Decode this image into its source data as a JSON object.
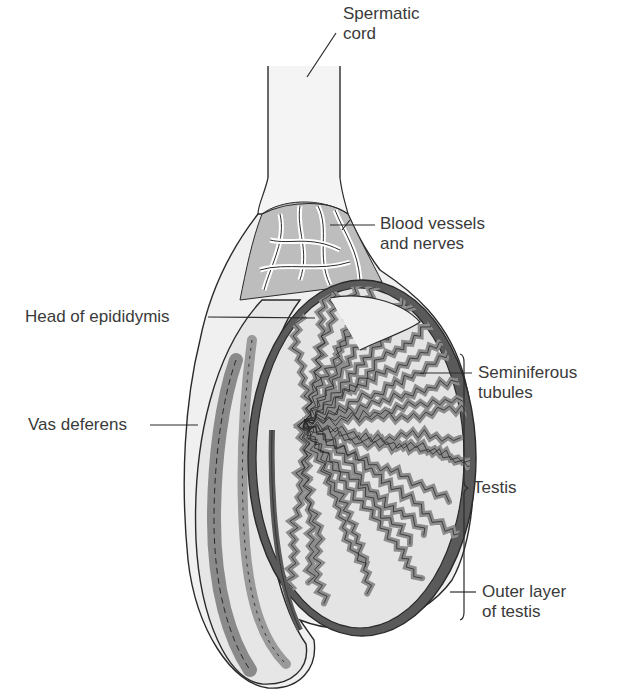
{
  "diagram": {
    "colors": {
      "outline": "#2a2a2a",
      "dark_layer": "#5a5a5a",
      "tubule_fill": "#8c8c8c",
      "light_fill": "#e4e4e4",
      "cord_fill": "#f4f4f4",
      "label_text": "#3a3a3a"
    },
    "labels": {
      "spermatic_cord": [
        "Spermatic",
        "cord"
      ],
      "blood_vessels": [
        "Blood vessels",
        "and nerves"
      ],
      "head_epididymis": [
        "Head of epididymis"
      ],
      "seminiferous": [
        "Seminiferous",
        "tubules"
      ],
      "vas_deferens": [
        "Vas deferens"
      ],
      "testis": [
        "Testis"
      ],
      "outer_layer": [
        "Outer layer",
        "of testis"
      ]
    }
  }
}
